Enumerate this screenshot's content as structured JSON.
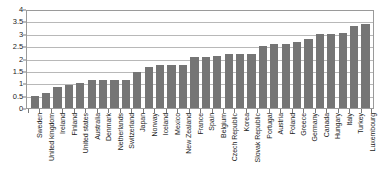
{
  "chart_data": {
    "type": "bar",
    "title": "",
    "xlabel": "",
    "ylabel": "",
    "ylim": [
      0,
      4
    ],
    "ytick_values": [
      0,
      0.5,
      1,
      1.5,
      2,
      2.5,
      3,
      3.5,
      4
    ],
    "ytick_labels": [
      "0",
      "0.5",
      "1",
      "1.5",
      "2",
      "2.5",
      "3",
      "3.5",
      "4"
    ],
    "grid": true,
    "legend": "none",
    "bar_color": "#757575",
    "categories": [
      "Sweden",
      "United kingdom",
      "Ireland",
      "Finland",
      "United states",
      "Australia",
      "Denmark",
      "Netherlands",
      "Switzerland",
      "Japan",
      "Norway",
      "Iceland",
      "Mexico",
      "New Zealand",
      "France",
      "Spain",
      "Belgium",
      "Czech Republic",
      "Korea",
      "Slovak Republic",
      "Portugal",
      "Austria",
      "Poland",
      "Greece",
      "Germany",
      "Canada",
      "Hungary",
      "Italy",
      "Turkey",
      "Luxembourg"
    ],
    "values": [
      0.5,
      0.6,
      0.85,
      0.95,
      1.0,
      1.15,
      1.15,
      1.15,
      1.15,
      1.45,
      1.65,
      1.75,
      1.75,
      1.75,
      2.05,
      2.05,
      2.1,
      2.2,
      2.2,
      2.2,
      2.5,
      2.6,
      2.6,
      2.65,
      2.8,
      3.0,
      3.0,
      3.05,
      3.3,
      3.4
    ]
  }
}
